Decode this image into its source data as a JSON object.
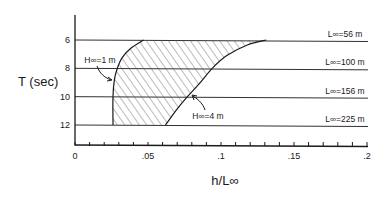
{
  "chart_data": {
    "type": "area",
    "title": "",
    "xlabel": "h/L∞",
    "ylabel": "T (sec)",
    "xlim": [
      0,
      0.2
    ],
    "ylim": [
      13.5,
      4.5
    ],
    "y_inverted": true,
    "grid": false,
    "x_ticks": [
      0,
      0.05,
      0.1,
      0.15,
      0.2
    ],
    "x_tick_labels": [
      "0",
      ".05",
      ".1",
      ".15",
      ".2"
    ],
    "x_minor_step": 0.01,
    "y_ticks": [
      6,
      8,
      10,
      12
    ],
    "y_tick_labels": [
      "6",
      "8",
      "10",
      "12"
    ],
    "reference_lines": [
      {
        "T": 6,
        "label": "L∞=56 m"
      },
      {
        "T": 8,
        "label": "L∞=100 m"
      },
      {
        "T": 10,
        "label": "L∞=156 m"
      },
      {
        "T": 12,
        "label": "L∞=225 m"
      }
    ],
    "series": [
      {
        "name": "H∞=1 m",
        "label": "H∞=1 m",
        "points": [
          [
            0.047,
            6
          ],
          [
            0.038,
            6.6
          ],
          [
            0.032,
            7.3
          ],
          [
            0.029,
            8
          ],
          [
            0.027,
            8.8
          ],
          [
            0.026,
            10
          ],
          [
            0.026,
            12
          ]
        ]
      },
      {
        "name": "H∞=4 m",
        "label": "H∞=4 m",
        "points": [
          [
            0.131,
            6
          ],
          [
            0.118,
            6.35
          ],
          [
            0.104,
            7.1
          ],
          [
            0.094,
            8
          ],
          [
            0.085,
            9.1
          ],
          [
            0.077,
            10
          ],
          [
            0.069,
            11
          ],
          [
            0.062,
            12
          ]
        ]
      }
    ],
    "shaded_region": "hatched area between H∞=1 m and H∞=4 m curves, T from 6 to 12 sec"
  }
}
